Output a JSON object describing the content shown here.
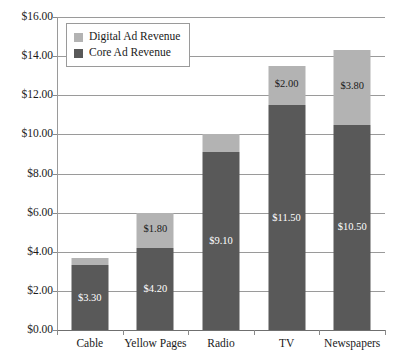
{
  "chart_data": {
    "type": "bar",
    "subtype": "stacked-bar",
    "title": "",
    "xlabel": "",
    "ylabel": "",
    "ylim": [
      0,
      16
    ],
    "ytick_step": 2,
    "ytick_labels": [
      "$0.00",
      "$2.00",
      "$4.00",
      "$6.00",
      "$8.00",
      "$10.00",
      "$12.00",
      "$14.00",
      "$16.00"
    ],
    "ytick_values": [
      0,
      2,
      4,
      6,
      8,
      10,
      12,
      14,
      16
    ],
    "grid": true,
    "grid_axis": "y",
    "legend_position": "top-left",
    "value_prefix": "$",
    "categories": [
      "Cable",
      "Yellow Pages",
      "Radio",
      "TV",
      "Newspapers"
    ],
    "series": [
      {
        "name": "Core Ad Revenue",
        "color": "#595959",
        "values": [
          3.3,
          4.2,
          9.1,
          11.5,
          10.5
        ],
        "labels": [
          "$3.30",
          "$4.20",
          "$9.10",
          "$11.50",
          "$10.50"
        ]
      },
      {
        "name": "Digital Ad Revenue",
        "color": "#b3b3b3",
        "values": [
          0.4,
          1.8,
          0.9,
          2.0,
          3.8
        ],
        "labels": [
          "$0.40",
          "$1.80",
          "$0.90",
          "$2.00",
          "$3.80"
        ]
      }
    ],
    "totals": [
      3.7,
      6.0,
      10.0,
      13.5,
      14.3
    ]
  },
  "legend": {
    "items": [
      {
        "label": "Digital Ad Revenue",
        "color": "#b3b3b3"
      },
      {
        "label": "Core Ad Revenue",
        "color": "#595959"
      }
    ]
  },
  "colors": {
    "core": "#595959",
    "digital": "#b3b3b3",
    "gridline": "#9a9a9a",
    "text": "#1a1a1a",
    "background": "#ffffff"
  }
}
